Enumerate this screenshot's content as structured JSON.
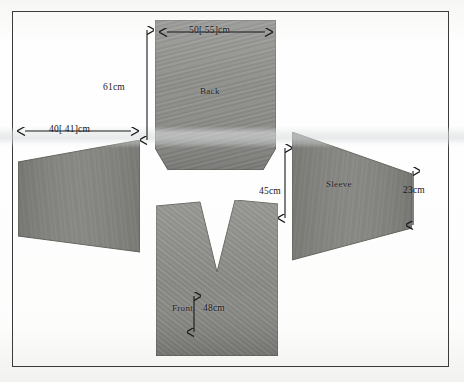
{
  "diagram": {
    "type": "sewing-pattern-schematic",
    "background_color": "#fefefe",
    "frame_color": "#3b3b3c",
    "fabric_color": "#8d8d8a",
    "annotation_color": "#17171a"
  },
  "pieces": [
    {
      "id": "back",
      "label": "Back",
      "shape": "rectangle-with-chamfered-bottom-corners"
    },
    {
      "id": "front",
      "label": "Front",
      "shape": "rectangle-with-v-neck-notch"
    },
    {
      "id": "sleeve-left",
      "label": "",
      "shape": "trapezoid-tapering-left"
    },
    {
      "id": "sleeve-right",
      "label": "Sleeve",
      "shape": "trapezoid-tapering-right"
    }
  ],
  "dimensions": {
    "back_width": "50[ 55]cm",
    "back_height": "61cm",
    "sleeve_left_length": "40[ 41]cm",
    "front_height": "45cm",
    "sleeve_cuff_height": "23cm",
    "front_width": "48cm"
  }
}
